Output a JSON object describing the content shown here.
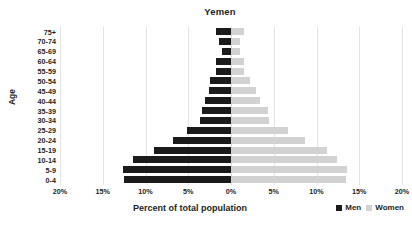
{
  "chart_data": {
    "type": "bar",
    "subtype": "population-pyramid",
    "title": "Yemen",
    "xlabel": "Percent of total population",
    "ylabel": "Age",
    "categories": [
      "0-4",
      "5-9",
      "10-14",
      "15-19",
      "20-24",
      "25-29",
      "30-34",
      "35-39",
      "40-44",
      "45-49",
      "50-54",
      "55-59",
      "60-64",
      "65-69",
      "70-74",
      "75+"
    ],
    "categories_display_order_top_to_bottom": [
      "75+",
      "70-74",
      "65-69",
      "60-64",
      "55-59",
      "50-54",
      "45-49",
      "40-44",
      "35-39",
      "30-34",
      "25-29",
      "20-24",
      "15-19",
      "10-14",
      "5-9",
      "0-4"
    ],
    "series": [
      {
        "name": "Men",
        "color": "#1b1b1b",
        "values": [
          12.5,
          12.6,
          11.5,
          9.0,
          6.8,
          5.2,
          3.6,
          3.4,
          3.0,
          2.6,
          2.4,
          1.7,
          1.8,
          1.1,
          1.4,
          1.7
        ]
      },
      {
        "name": "Women",
        "color": "#d2d2d2",
        "values": [
          13.4,
          13.6,
          12.4,
          11.2,
          8.7,
          6.7,
          4.4,
          4.3,
          3.4,
          2.9,
          2.2,
          1.5,
          1.5,
          1.0,
          1.0,
          1.5
        ]
      }
    ],
    "xlim": [
      -20,
      20
    ],
    "xticks": [
      -20,
      -15,
      -10,
      -5,
      0,
      5,
      10,
      15,
      20
    ],
    "xtick_labels": [
      "20%",
      "15%",
      "10%",
      "5%",
      "0%",
      "5%",
      "10%",
      "15%",
      "20%"
    ],
    "grid": true,
    "legend_position": "bottom-right"
  },
  "legend": {
    "items": [
      {
        "label": "Men",
        "color": "#1b1b1b"
      },
      {
        "label": "Women",
        "color": "#d2d2d2"
      }
    ]
  }
}
